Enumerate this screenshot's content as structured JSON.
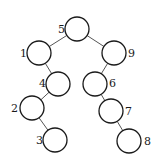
{
  "diagram": {
    "type": "binary-search-tree",
    "node_radius": 12,
    "nodes": [
      {
        "id": "n5",
        "label": "5",
        "cx": 77,
        "cy": 29,
        "lx": 58,
        "ly": 33
      },
      {
        "id": "n1",
        "label": "1",
        "cx": 39,
        "cy": 53,
        "lx": 20,
        "ly": 57
      },
      {
        "id": "n9",
        "label": "9",
        "cx": 114,
        "cy": 53,
        "lx": 128,
        "ly": 57
      },
      {
        "id": "n4",
        "label": "4",
        "cx": 58,
        "cy": 84,
        "lx": 39,
        "ly": 87
      },
      {
        "id": "n6",
        "label": "6",
        "cx": 95,
        "cy": 84,
        "lx": 109,
        "ly": 87
      },
      {
        "id": "n2",
        "label": "2",
        "cx": 32,
        "cy": 108,
        "lx": 11,
        "ly": 112
      },
      {
        "id": "n7",
        "label": "7",
        "cx": 111,
        "cy": 111,
        "lx": 125,
        "ly": 115
      },
      {
        "id": "n3",
        "label": "3",
        "cx": 55,
        "cy": 140,
        "lx": 36,
        "ly": 144
      },
      {
        "id": "n8",
        "label": "8",
        "cx": 129,
        "cy": 141,
        "lx": 144,
        "ly": 145
      }
    ],
    "edges": [
      {
        "from": "n5",
        "to": "n1"
      },
      {
        "from": "n5",
        "to": "n9"
      },
      {
        "from": "n1",
        "to": "n4"
      },
      {
        "from": "n4",
        "to": "n2"
      },
      {
        "from": "n2",
        "to": "n3"
      },
      {
        "from": "n9",
        "to": "n6"
      },
      {
        "from": "n6",
        "to": "n7"
      },
      {
        "from": "n7",
        "to": "n8"
      }
    ]
  }
}
